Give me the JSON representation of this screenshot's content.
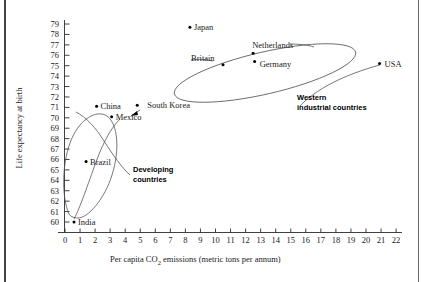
{
  "figure": {
    "title": "",
    "background": "#ffffff",
    "frame_color": "#444444"
  },
  "chart_data": {
    "type": "scatter",
    "title": "",
    "xlabel": "Per capita CO2 emissions (metric tons per annum)",
    "xlabel_main": "Per capita CO",
    "xlabel_sub": "2",
    "xlabel_tail": " emissions (metric tons per annum)",
    "ylabel": "Life expectancy at birth",
    "xlim": [
      0,
      22
    ],
    "ylim": [
      60,
      79
    ],
    "grid": false,
    "legend": false,
    "xticks": [
      "0",
      "1",
      "2",
      "3",
      "4",
      "5",
      "6",
      "7",
      "8",
      "9",
      "10",
      "11",
      "12",
      "13",
      "14",
      "15",
      "16",
      "17",
      "18",
      "19",
      "20",
      "21",
      "22"
    ],
    "yticks": [
      "60",
      "61",
      "62",
      "63",
      "64",
      "65",
      "66",
      "67",
      "68",
      "69",
      "70",
      "71",
      "72",
      "73",
      "74",
      "75",
      "76",
      "77",
      "78",
      "79"
    ],
    "points": [
      {
        "name": "India",
        "x": 0.6,
        "y": 60.0,
        "label_dx": 4,
        "label_dy": 3
      },
      {
        "name": "Brazil",
        "x": 1.4,
        "y": 65.8,
        "label_dx": 4,
        "label_dy": 3
      },
      {
        "name": "China",
        "x": 2.1,
        "y": 71.1,
        "label_dx": 4,
        "label_dy": 3
      },
      {
        "name": "Mexico",
        "x": 3.1,
        "y": 70.1,
        "label_dx": 4,
        "label_dy": 3
      },
      {
        "name": "South Korea",
        "x": 4.8,
        "y": 71.2,
        "label_dx": 10,
        "label_dy": 3
      },
      {
        "name": "Japan",
        "x": 8.3,
        "y": 78.7,
        "label_dx": 4,
        "label_dy": 3
      },
      {
        "name": "Britain",
        "x": 10.5,
        "y": 75.1,
        "label_dx": -32,
        "label_dy": -4
      },
      {
        "name": "Netherlands",
        "x": 12.5,
        "y": 76.2,
        "label_dx": -1,
        "label_dy": -5
      },
      {
        "name": "Germany",
        "x": 12.6,
        "y": 75.4,
        "label_dx": 5,
        "label_dy": 5
      },
      {
        "name": "USA",
        "x": 20.9,
        "y": 75.2,
        "label_dx": 5,
        "label_dy": 3
      }
    ],
    "annotations": [
      {
        "name": "developing-countries",
        "line1": "Developing",
        "line2": "countries"
      },
      {
        "name": "western-industrial-countries",
        "line1": "Western",
        "line2": "industrial countries"
      }
    ]
  }
}
